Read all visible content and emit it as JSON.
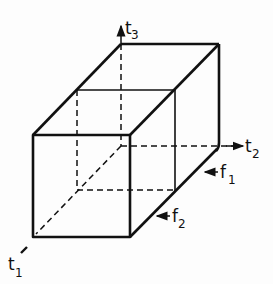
{
  "diagram": {
    "type": "3d-box-time-frequency",
    "stroke_color": "#111111",
    "axes": [
      {
        "name": "t",
        "sub": "3",
        "direction": "up"
      },
      {
        "name": "t",
        "sub": "2",
        "direction": "right"
      },
      {
        "name": "t",
        "sub": "1",
        "direction": "down-left"
      }
    ],
    "faces": [
      {
        "name": "f",
        "sub": "1"
      },
      {
        "name": "f",
        "sub": "2"
      }
    ]
  }
}
